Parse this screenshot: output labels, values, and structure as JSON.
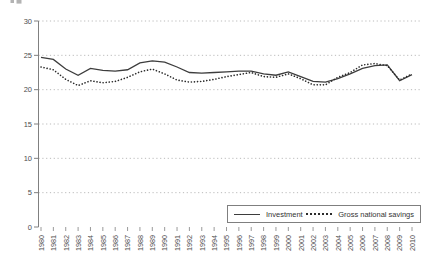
{
  "chart_data": {
    "type": "line",
    "title": "",
    "xlabel": "",
    "ylabel": "",
    "x": [
      1980,
      1981,
      1982,
      1983,
      1984,
      1985,
      1986,
      1987,
      1988,
      1989,
      1990,
      1991,
      1992,
      1993,
      1994,
      1995,
      1996,
      1997,
      1998,
      1999,
      2000,
      2001,
      2002,
      2003,
      2004,
      2005,
      2006,
      2007,
      2008,
      2009,
      2010
    ],
    "series": [
      {
        "name": "Investment",
        "line_style": "solid",
        "color": "#3d3d3d",
        "values": [
          24.7,
          24.4,
          23.0,
          22.1,
          23.1,
          22.8,
          22.7,
          22.9,
          23.9,
          24.2,
          24.0,
          23.3,
          22.5,
          22.4,
          22.5,
          22.6,
          22.7,
          22.7,
          22.3,
          22.1,
          22.6,
          21.9,
          21.2,
          21.1,
          21.6,
          22.3,
          23.1,
          23.5,
          23.6,
          21.3,
          22.2
        ]
      },
      {
        "name": "Gross national savings",
        "line_style": "dotted",
        "color": "#2b2b2b",
        "values": [
          23.3,
          22.9,
          21.5,
          20.6,
          21.3,
          21.0,
          21.2,
          21.8,
          22.6,
          23.0,
          22.3,
          21.4,
          21.1,
          21.2,
          21.5,
          21.9,
          22.2,
          22.5,
          21.9,
          21.8,
          22.3,
          21.6,
          20.7,
          20.7,
          21.8,
          22.5,
          23.6,
          23.8,
          23.5,
          21.4,
          22.3
        ]
      }
    ],
    "ylim": [
      0,
      30
    ],
    "yticks": [
      0,
      5,
      10,
      15,
      20,
      25,
      30
    ],
    "grid": "horizontal dotted gridlines at y ticks above 0",
    "legend_position": "bottom-right inside plot, boxed",
    "axis_color": "#808080",
    "gridline_color": "#b3b3b3",
    "tick_label_color": "#4d4d4d"
  }
}
